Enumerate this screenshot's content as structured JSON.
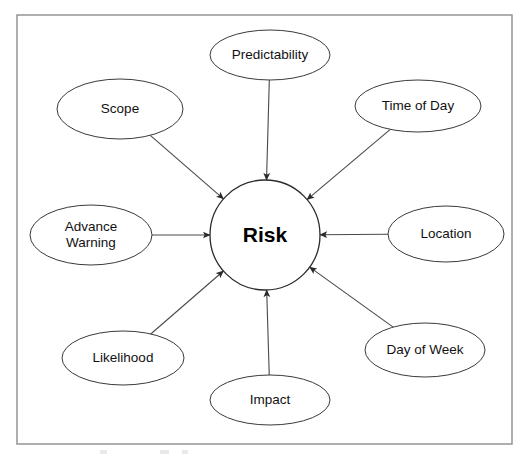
{
  "diagram": {
    "title": "Risk",
    "center": {
      "label": "Risk",
      "shape": "circle",
      "cx": 265,
      "cy": 235,
      "r": 55
    },
    "frame": {
      "x": 17,
      "y": 15,
      "width": 495,
      "height": 429,
      "color": "#8d8d8d"
    },
    "colors": {
      "background": "#ffffff",
      "node_stroke": "#3a3a3a",
      "edge_stroke": "#4a4a4a",
      "text": "#111111",
      "center_text": "#000000",
      "frame": "#8d8d8d"
    },
    "edge_style": {
      "type": "arrow",
      "direction": "toward-center",
      "arrowhead": "solid-triangle"
    },
    "nodes": [
      {
        "id": "predictability",
        "label": "Predictability",
        "cx": 270,
        "cy": 55,
        "rx": 60,
        "ry": 25,
        "lines": [
          "Predictability"
        ],
        "angle_deg": 90
      },
      {
        "id": "scope",
        "label": "Scope",
        "cx": 120,
        "cy": 109,
        "rx": 63,
        "ry": 30,
        "lines": [
          "Scope"
        ],
        "angle_deg": 135
      },
      {
        "id": "time-of-day",
        "label": "Time of Day",
        "cx": 418,
        "cy": 106,
        "rx": 63,
        "ry": 26,
        "lines": [
          "Time of Day"
        ],
        "angle_deg": 45
      },
      {
        "id": "advance-warning",
        "label": "Advance Warning",
        "cx": 91,
        "cy": 235,
        "rx": 61,
        "ry": 30,
        "lines": [
          "Advance",
          "Warning"
        ],
        "angle_deg": 180
      },
      {
        "id": "location",
        "label": "Location",
        "cx": 446,
        "cy": 234,
        "rx": 58,
        "ry": 28,
        "lines": [
          "Location"
        ],
        "angle_deg": 0
      },
      {
        "id": "likelihood",
        "label": "Likelihood",
        "cx": 123,
        "cy": 358,
        "rx": 61,
        "ry": 27,
        "lines": [
          "Likelihood"
        ],
        "angle_deg": 225
      },
      {
        "id": "impact",
        "label": "Impact",
        "cx": 270,
        "cy": 400,
        "rx": 60,
        "ry": 25,
        "lines": [
          "Impact"
        ],
        "angle_deg": 270
      },
      {
        "id": "day-of-week",
        "label": "Day of Week",
        "cx": 425,
        "cy": 350,
        "rx": 60,
        "ry": 27,
        "lines": [
          "Day of Week"
        ],
        "angle_deg": 315
      }
    ],
    "edges": [
      {
        "from": "predictability",
        "to": "center"
      },
      {
        "from": "scope",
        "to": "center"
      },
      {
        "from": "time-of-day",
        "to": "center"
      },
      {
        "from": "advance-warning",
        "to": "center"
      },
      {
        "from": "location",
        "to": "center"
      },
      {
        "from": "likelihood",
        "to": "center"
      },
      {
        "from": "impact",
        "to": "center"
      },
      {
        "from": "day-of-week",
        "to": "center"
      }
    ]
  }
}
